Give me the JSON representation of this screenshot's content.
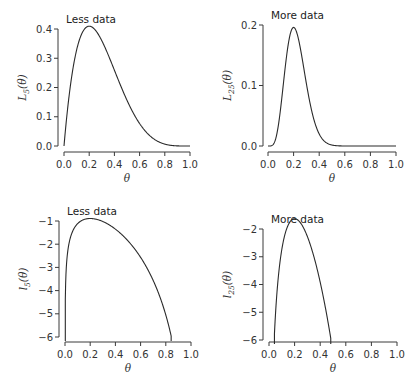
{
  "chart_data": [
    {
      "type": "line",
      "id": "top-left",
      "title": "Less data",
      "xlabel": "θ",
      "ylabel": "L5(θ)",
      "ylabel_main": "L",
      "ylabel_sub": "5",
      "xlim": [
        0,
        1
      ],
      "ylim": [
        0,
        0.4
      ],
      "xticks": [
        0.0,
        0.2,
        0.4,
        0.6,
        0.8,
        1.0
      ],
      "xtick_labels": [
        "0.0",
        "0.2",
        "0.4",
        "0.6",
        "0.8",
        "1.0"
      ],
      "yticks": [
        0.0,
        0.1,
        0.2,
        0.3,
        0.4
      ],
      "ytick_labels": [
        "0.0",
        "0.1",
        "0.2",
        "0.3",
        "0.4"
      ],
      "grid": false,
      "series": [
        {
          "name": "Binomial likelihood n=5, k=1",
          "n": 5,
          "k": 1,
          "log": false
        }
      ],
      "x": [
        0.0,
        0.1,
        0.2,
        0.3,
        0.4,
        0.5,
        0.6,
        0.7,
        0.8,
        0.9,
        1.0
      ],
      "values": [
        0.0,
        0.328,
        0.41,
        0.36,
        0.259,
        0.156,
        0.077,
        0.028,
        0.006,
        0.0005,
        0.0
      ],
      "frame": {
        "left": 64,
        "right": 190,
        "top": 29,
        "bottom": 146,
        "xaxis_y": 152,
        "yaxis_x": 58
      }
    },
    {
      "type": "line",
      "id": "top-right",
      "title": "More data",
      "xlabel": "θ",
      "ylabel": "L25(θ)",
      "ylabel_main": "L",
      "ylabel_sub": "25",
      "xlim": [
        0,
        1
      ],
      "ylim": [
        0,
        0.2
      ],
      "xticks": [
        0.0,
        0.2,
        0.4,
        0.6,
        0.8,
        1.0
      ],
      "xtick_labels": [
        "0.0",
        "0.2",
        "0.4",
        "0.6",
        "0.8",
        "1.0"
      ],
      "yticks": [
        0.0,
        0.1,
        0.2
      ],
      "ytick_labels": [
        "0.0",
        "0.1",
        "0.2"
      ],
      "grid": false,
      "series": [
        {
          "name": "Binomial likelihood n=25, k=5",
          "n": 25,
          "k": 5,
          "log": false
        }
      ],
      "x": [
        0.0,
        0.1,
        0.2,
        0.3,
        0.4,
        0.5,
        0.6,
        1.0
      ],
      "values": [
        0.0,
        0.065,
        0.196,
        0.103,
        0.029,
        0.002,
        0.0,
        0.0
      ],
      "frame": {
        "left": 268,
        "right": 396,
        "top": 25,
        "bottom": 146,
        "xaxis_y": 152,
        "yaxis_x": 263
      }
    },
    {
      "type": "line",
      "id": "bottom-left",
      "title": "Less data",
      "xlabel": "θ",
      "ylabel": "l5(θ)",
      "ylabel_main": "l",
      "ylabel_sub": "5",
      "xlim": [
        0,
        1
      ],
      "ylim": [
        -6,
        -1
      ],
      "xticks": [
        0.0,
        0.2,
        0.4,
        0.6,
        0.8,
        1.0
      ],
      "xtick_labels": [
        "0.0",
        "0.2",
        "0.4",
        "0.6",
        "0.8",
        "1.0"
      ],
      "yticks": [
        -1,
        -2,
        -3,
        -4,
        -5,
        -6
      ],
      "ytick_labels": [
        "−1",
        "−2",
        "−3",
        "−4",
        "−5",
        "−6"
      ],
      "grid": false,
      "series": [
        {
          "name": "Log-likelihood n=5, k=1",
          "n": 5,
          "k": 1,
          "log": true
        }
      ],
      "x": [
        0.0025,
        0.1,
        0.2,
        0.3,
        0.4,
        0.5,
        0.6,
        0.7,
        0.8,
        0.85
      ],
      "values": [
        -6.0,
        -1.11,
        -0.89,
        -1.02,
        -1.35,
        -1.86,
        -2.56,
        -3.58,
        -5.12,
        -6.0
      ],
      "frame": {
        "left": 65,
        "right": 191,
        "top": 221,
        "bottom": 337,
        "xaxis_y": 342,
        "yaxis_x": 59
      }
    },
    {
      "type": "line",
      "id": "bottom-right",
      "title": "More data",
      "xlabel": "θ",
      "ylabel": "l25(θ)",
      "ylabel_main": "l",
      "ylabel_sub": "25",
      "xlim": [
        0,
        1
      ],
      "ylim": [
        -6,
        -2
      ],
      "xticks": [
        0.0,
        0.2,
        0.4,
        0.6,
        0.8,
        1.0
      ],
      "xtick_labels": [
        "0.0",
        "0.2",
        "0.4",
        "0.6",
        "0.8",
        "1.0"
      ],
      "yticks": [
        -2,
        -3,
        -4,
        -5,
        -6
      ],
      "ytick_labels": [
        "−2",
        "−3",
        "−4",
        "−5",
        "−6"
      ],
      "grid": false,
      "series": [
        {
          "name": "Log-likelihood n=25, k=5",
          "n": 25,
          "k": 5,
          "log": true
        }
      ],
      "x": [
        0.045,
        0.1,
        0.2,
        0.3,
        0.4,
        0.49
      ],
      "values": [
        -6.0,
        -2.73,
        -1.63,
        -2.27,
        -3.53,
        -6.0
      ],
      "frame": {
        "left": 269,
        "right": 397,
        "top": 229,
        "bottom": 340,
        "xaxis_y": 342,
        "yaxis_x": 263
      }
    }
  ]
}
